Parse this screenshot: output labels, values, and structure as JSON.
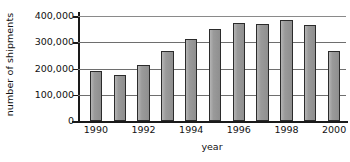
{
  "chart_data": {
    "type": "bar",
    "title": "",
    "xlabel": "year",
    "ylabel": "number of shipments",
    "categories": [
      "1990",
      "1991",
      "1992",
      "1993",
      "1994",
      "1995",
      "1996",
      "1997",
      "1998",
      "1999",
      "2000"
    ],
    "values": [
      190000,
      175000,
      215000,
      268000,
      312000,
      350000,
      375000,
      370000,
      385000,
      365000,
      268000
    ],
    "ylim": [
      0,
      400000
    ],
    "ytick_values": [
      0,
      100000,
      200000,
      300000,
      400000
    ],
    "ytick_labels": [
      "0",
      "100,000",
      "200,000",
      "300,000",
      "400,000"
    ],
    "xtick_labels": [
      "1990",
      "1992",
      "1994",
      "1996",
      "1998",
      "2000"
    ],
    "xtick_categories": [
      "1990",
      "1992",
      "1994",
      "1996",
      "1998",
      "2000"
    ],
    "grid": true,
    "grid_axis": "y",
    "legend": false,
    "legend_position": "none",
    "bar_color": "#9b9b9b",
    "bar_edge_color": "#2b2b2b",
    "grid_color": "#6e6e6e",
    "axis_color": "#1a1a1a",
    "background_color": "#ffffff"
  }
}
